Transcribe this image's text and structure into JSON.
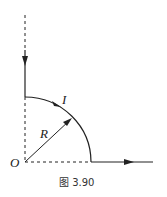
{
  "figure": {
    "caption": "图 3.90",
    "labels": {
      "current": "I",
      "radius": "R",
      "origin": "O"
    },
    "elements": [
      {
        "type": "dashed-line",
        "description": "vertical dashed line above wire"
      },
      {
        "type": "wire",
        "description": "vertical wire with downward current arrow"
      },
      {
        "type": "arc",
        "description": "quarter-circle arc of radius R carrying current I"
      },
      {
        "type": "dashed-line",
        "description": "vertical dashed line from arc start to O"
      },
      {
        "type": "dashed-line",
        "description": "horizontal dashed line from O to arc end"
      },
      {
        "type": "radius-arrow",
        "description": "arrow from O to arc labeled R"
      },
      {
        "type": "wire",
        "description": "horizontal wire with rightward current arrow"
      }
    ],
    "colors": {
      "ink": "#222222",
      "background": "#ffffff"
    }
  }
}
